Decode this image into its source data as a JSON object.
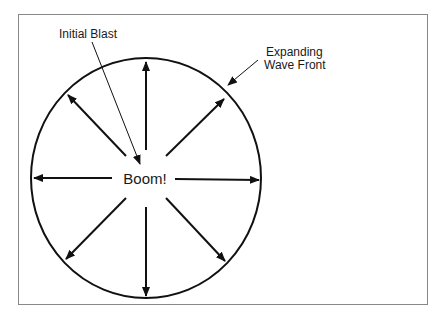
{
  "diagram": {
    "center_label": "Boom!",
    "labels": {
      "initial_blast": "Initial Blast",
      "wave_front_line1": "Expanding",
      "wave_front_line2": "Wave Front"
    },
    "colors": {
      "stroke": "#111111",
      "frame": "#888888",
      "background": "#ffffff"
    },
    "arrow_count": 8
  }
}
